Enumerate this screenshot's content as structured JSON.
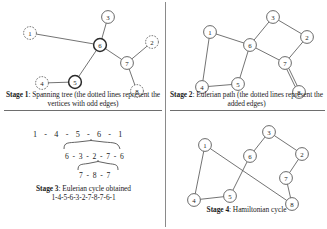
{
  "figure": {
    "panels": [
      {
        "id": "stage1",
        "caption_label": "Stage 1",
        "caption_text": ": Spanning tree (the dotted lines represent the vertices with odd edges)",
        "graph": {
          "nodes": [
            {
              "id": "1",
              "x": 24,
              "y": 29,
              "style": "dotted"
            },
            {
              "id": "2",
              "x": 146,
              "y": 38,
              "style": "dotted"
            },
            {
              "id": "3",
              "x": 102,
              "y": 13,
              "style": "solid"
            },
            {
              "id": "4",
              "x": 36,
              "y": 79,
              "style": "dotted"
            },
            {
              "id": "5",
              "x": 69,
              "y": 78,
              "style": "bold"
            },
            {
              "id": "6",
              "x": 94,
              "y": 41,
              "style": "bold"
            },
            {
              "id": "7",
              "x": 121,
              "y": 59,
              "style": "solid"
            },
            {
              "id": "8",
              "x": 131,
              "y": 87,
              "style": "dotted"
            }
          ],
          "edges": [
            [
              "1",
              "6"
            ],
            [
              "3",
              "6"
            ],
            [
              "5",
              "6"
            ],
            [
              "6",
              "7"
            ],
            [
              "4",
              "5"
            ],
            [
              "7",
              "2"
            ],
            [
              "7",
              "8"
            ]
          ]
        }
      },
      {
        "id": "stage2",
        "caption_label": "Stage 2",
        "caption_text": ": Eulerian path (the dotted lines represent the added edges)",
        "graph": {
          "nodes": [
            {
              "id": "1",
              "x": 30,
              "y": 28,
              "style": "solid"
            },
            {
              "id": "2",
              "x": 127,
              "y": 33,
              "style": "solid"
            },
            {
              "id": "3",
              "x": 93,
              "y": 13,
              "style": "solid"
            },
            {
              "id": "4",
              "x": 22,
              "y": 83,
              "style": "solid"
            },
            {
              "id": "5",
              "x": 58,
              "y": 80,
              "style": "solid"
            },
            {
              "id": "6",
              "x": 70,
              "y": 41,
              "style": "solid"
            },
            {
              "id": "7",
              "x": 105,
              "y": 59,
              "style": "solid"
            },
            {
              "id": "8",
              "x": 119,
              "y": 88,
              "style": "solid"
            }
          ],
          "edges": [
            [
              "1",
              "6"
            ],
            [
              "3",
              "6"
            ],
            [
              "5",
              "6"
            ],
            [
              "6",
              "7"
            ],
            [
              "4",
              "5"
            ],
            [
              "7",
              "2"
            ],
            [
              "2",
              "3"
            ],
            [
              "1",
              "4"
            ]
          ],
          "double_edges": [
            [
              "7",
              "8"
            ]
          ]
        }
      },
      {
        "id": "stage3",
        "caption_label": "Stage 3",
        "caption_text": ": Eulerian cycle obtained",
        "result": "1-4-5-6-3-2-7-8-7-6-1",
        "expression": {
          "row1": "1 - 4 - 5 - 6 - 1",
          "row2": "6 - 3 - 2 - 7 - 6",
          "row3": "7 - 8 - 7"
        }
      },
      {
        "id": "stage4",
        "caption_label": "Stage 4",
        "caption_text": ": Hamiltonian cycle",
        "graph": {
          "nodes": [
            {
              "id": "1",
              "x": 23,
              "y": 21,
              "style": "solid"
            },
            {
              "id": "2",
              "x": 120,
              "y": 30,
              "style": "solid"
            },
            {
              "id": "3",
              "x": 87,
              "y": 8,
              "style": "solid"
            },
            {
              "id": "4",
              "x": 12,
              "y": 76,
              "style": "solid"
            },
            {
              "id": "5",
              "x": 48,
              "y": 72,
              "style": "solid"
            },
            {
              "id": "6",
              "x": 68,
              "y": 32,
              "style": "solid"
            },
            {
              "id": "7",
              "x": 104,
              "y": 54,
              "style": "solid"
            },
            {
              "id": "8",
              "x": 110,
              "y": 80,
              "style": "solid"
            }
          ],
          "edges": [
            [
              "1",
              "8"
            ],
            [
              "1",
              "4"
            ],
            [
              "4",
              "5"
            ],
            [
              "5",
              "6"
            ],
            [
              "6",
              "3"
            ],
            [
              "3",
              "2"
            ],
            [
              "2",
              "7"
            ],
            [
              "7",
              "8"
            ]
          ]
        }
      }
    ],
    "colors": {
      "ink": "#1c1c1c",
      "edge": "#555555",
      "node_fill": "#ffffff",
      "divider": "#6e6e6e"
    }
  }
}
